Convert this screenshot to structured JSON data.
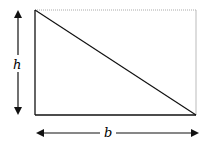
{
  "diagram": {
    "title": "",
    "labels": {
      "height": "h",
      "base": "b"
    },
    "shape": "right-triangle-in-rectangle",
    "colors": {
      "solid": "#111111",
      "dotted": "#aaaaaa",
      "background": "#ffffff"
    }
  }
}
